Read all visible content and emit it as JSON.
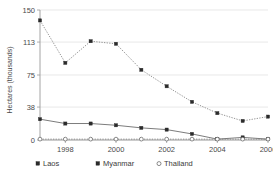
{
  "chart_data": {
    "type": "line",
    "title": "",
    "xlabel": "",
    "ylabel": "Hectares (thousands)",
    "x": [
      1997,
      1998,
      1999,
      2000,
      2001,
      2002,
      2003,
      2004,
      2005,
      2006
    ],
    "xtick_labels": [
      "1998",
      "2000",
      "2002",
      "2004",
      "2006"
    ],
    "xticks": [
      1998,
      2000,
      2002,
      2004,
      2006
    ],
    "ytick_labels": [
      "0",
      "38",
      "75",
      "113",
      "150"
    ],
    "yticks": [
      0,
      38,
      75,
      113,
      150
    ],
    "ylim": [
      0,
      150
    ],
    "xlim": [
      1997,
      2006
    ],
    "grid": "horizontal",
    "legend_position": "bottom",
    "series": [
      {
        "name": "Laos",
        "marker": "filled-square",
        "linestyle": "solid",
        "values": [
          24,
          19,
          19,
          17,
          14,
          12,
          7,
          1,
          3,
          1
        ]
      },
      {
        "name": "Myanmar",
        "marker": "filled-square",
        "linestyle": "dotted",
        "values": [
          138,
          89,
          114,
          111,
          81,
          62,
          44,
          31,
          22,
          27
        ]
      },
      {
        "name": "Thailand",
        "marker": "open-circle",
        "linestyle": "dotted",
        "values": [
          1,
          1,
          1,
          1,
          1,
          1,
          1,
          1,
          1,
          1
        ]
      }
    ]
  },
  "axis": {
    "y_title": "Hectares (thousands)",
    "y_ticks": [
      "150",
      "113",
      "75",
      "38",
      "0"
    ],
    "x_ticks": [
      "1998",
      "2000",
      "2002",
      "2004",
      "2006"
    ]
  },
  "legend": {
    "items": [
      {
        "label": "Laos",
        "marker": "filled-square"
      },
      {
        "label": "Myanmar",
        "marker": "filled-square"
      },
      {
        "label": "Thailand",
        "marker": "open-circle"
      }
    ]
  },
  "colors": {
    "grid": "#d9d9d9",
    "axis": "#9a9a9a",
    "laos": "#5a5a5a",
    "myanmar": "#7a7a7a",
    "thailand": "#5a5a5a",
    "marker_fill": "#2b2b2b",
    "background": "#ffffff"
  }
}
